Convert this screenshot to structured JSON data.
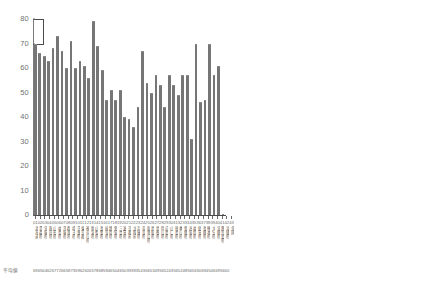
{
  "chart_data": {
    "type": "bar",
    "title": "",
    "subtitle": "",
    "xlabel": "",
    "ylabel": "",
    "ylim": [
      0,
      80
    ],
    "yticks": [
      0,
      10,
      20,
      30,
      40,
      50,
      60,
      70,
      80
    ],
    "grid": false,
    "legend": null,
    "bar_color": "#767676",
    "axis_color": "#4a4a4a",
    "value_row_caption": "平均値",
    "categories": [
      "北海道",
      "青森県",
      "宮城県",
      "秋田県",
      "山形県",
      "福島県",
      "茨城県",
      "群馬県",
      "埼玉県",
      "千葉県",
      "東京都",
      "神奈川県",
      "新潟県",
      "山梨県",
      "長野県",
      "岐阜県",
      "静岡県",
      "愛知県",
      "三重県",
      "滋賀県",
      "京都府",
      "大阪府",
      "兵庫県",
      "奈良県",
      "和歌山県",
      "鳥取県",
      "島根県",
      "岡山県",
      "広島県",
      "山口県",
      "徳島県",
      "香川県",
      "愛媛県",
      "高知県",
      "福岡県",
      "佐賀県",
      "長崎県",
      "熊本県",
      "大分県",
      "宮崎県",
      "鹿児島県",
      "沖縄県",
      "全国"
    ],
    "category_numbers": [
      "01",
      "02",
      "03",
      "04",
      "05",
      "06",
      "07",
      "08",
      "09",
      "10",
      "11",
      "12",
      "13",
      "14",
      "15",
      "16",
      "17",
      "18",
      "19",
      "20",
      "21",
      "22",
      "23",
      "24",
      "25",
      "26",
      "27",
      "28",
      "29",
      "30",
      "31",
      "32",
      "33",
      "34",
      "35",
      "36",
      "37",
      "38",
      "39",
      "40",
      "41",
      "42",
      "43"
    ],
    "values": [
      70,
      66,
      65,
      63,
      68,
      73,
      67,
      60,
      71,
      60,
      63,
      61,
      56,
      79,
      69,
      59,
      47,
      51,
      47,
      51,
      40,
      39,
      36,
      44,
      67,
      54,
      50,
      57,
      53,
      44,
      57,
      53,
      49,
      57,
      57,
      31,
      70,
      46,
      47,
      70,
      57,
      61,
      0
    ],
    "value_labels": [
      "69",
      "65",
      "64",
      "62",
      "67",
      "72",
      "66",
      "58",
      "73",
      "59",
      "62",
      "60",
      "55",
      "78",
      "68",
      "58",
      "46",
      "50",
      "46",
      "50",
      "39",
      "38",
      "35",
      "43",
      "66",
      "53",
      "49",
      "56",
      "52",
      "43",
      "56",
      "52",
      "48",
      "56",
      "56",
      "30",
      "69",
      "45",
      "46",
      "69",
      "56",
      "60",
      ""
    ]
  }
}
